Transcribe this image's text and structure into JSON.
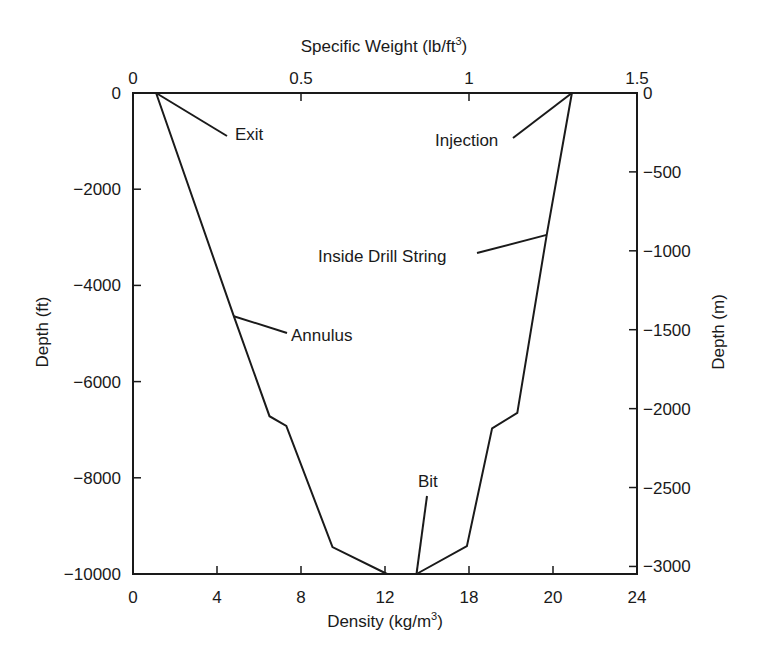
{
  "chart_data": {
    "type": "line",
    "title": "",
    "xlabel_bottom": "Density (kg/m",
    "xlabel_bottom_sup": "3",
    "xlabel_top": "Specific Weight (lb/ft",
    "xlabel_top_sup": "3",
    "ylabel_left": "Depth (ft)",
    "ylabel_right": "Depth (m)",
    "xlim": [
      0,
      24
    ],
    "ylim": [
      -10000,
      0
    ],
    "grid": false,
    "legend": "none (series labeled with leader-line annotations)",
    "bottom_ticks": [
      {
        "pos": 0,
        "label": "0"
      },
      {
        "pos": 4,
        "label": "4"
      },
      {
        "pos": 8,
        "label": "8"
      },
      {
        "pos": 12,
        "label": "12"
      },
      {
        "pos": 16,
        "label": "18"
      },
      {
        "pos": 20,
        "label": "20"
      },
      {
        "pos": 24,
        "label": "24"
      }
    ],
    "top_ticks": [
      {
        "pos": 0,
        "label": "0"
      },
      {
        "pos": 8,
        "label": "0.5"
      },
      {
        "pos": 16,
        "label": "1"
      },
      {
        "pos": 24,
        "label": "1.5"
      }
    ],
    "left_ticks": [
      {
        "pos": 0,
        "label": "0"
      },
      {
        "pos": -2000,
        "label": "−2000"
      },
      {
        "pos": -4000,
        "label": "−4000"
      },
      {
        "pos": -6000,
        "label": "−6000"
      },
      {
        "pos": -8000,
        "label": "−8000"
      },
      {
        "pos": -10000,
        "label": "−10000"
      }
    ],
    "right_ticks": [
      {
        "pos": 0,
        "label": "0"
      },
      {
        "pos": -1640,
        "label": "−500"
      },
      {
        "pos": -3281,
        "label": "−1000"
      },
      {
        "pos": -4921,
        "label": "−1500"
      },
      {
        "pos": -6562,
        "label": "−2000"
      },
      {
        "pos": -8202,
        "label": "−2500"
      },
      {
        "pos": -9843,
        "label": "−3000"
      }
    ],
    "series": [
      {
        "name": "Annulus",
        "x": [
          1.1,
          4.8,
          6.5,
          7.3,
          9.5,
          12.1
        ],
        "y": [
          0,
          -4640,
          -6720,
          -6920,
          -9440,
          -10000
        ]
      },
      {
        "name": "Inside Drill String",
        "x": [
          20.9,
          19.7,
          18.3,
          17.1,
          15.9,
          13.5
        ],
        "y": [
          0,
          -2950,
          -6650,
          -6970,
          -9420,
          -10000
        ]
      }
    ],
    "annotations": [
      {
        "text": "Exit",
        "point": [
          1.1,
          0
        ],
        "label_px": [
          235,
          140
        ],
        "leader_end_px": [
          227,
          136
        ]
      },
      {
        "text": "Injection",
        "point": [
          20.9,
          0
        ],
        "label_px": [
          435,
          146
        ],
        "leader_end_px": [
          513,
          138
        ]
      },
      {
        "text": "Inside Drill String",
        "point": [
          19.7,
          -2950
        ],
        "label_px": [
          318,
          262
        ],
        "leader_end_px": [
          477,
          253
        ]
      },
      {
        "text": "Annulus",
        "point": [
          4.8,
          -4640
        ],
        "label_px": [
          291,
          341
        ],
        "leader_end_px": [
          287,
          333
        ]
      },
      {
        "text": "Bit",
        "point": [
          13.5,
          -10000
        ],
        "label_px": [
          418,
          487
        ],
        "leader_end_px": [
          427,
          496
        ]
      }
    ]
  },
  "layout": {
    "plot_left": 133,
    "plot_right": 637,
    "plot_top": 93,
    "plot_bottom": 574,
    "line_color": "#1a1a1a"
  }
}
